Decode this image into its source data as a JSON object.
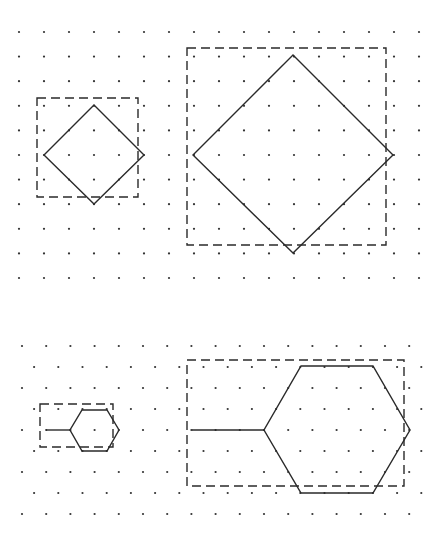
{
  "colors": {
    "ink": "#2a2a2a",
    "dot": "#333333",
    "background": "#ffffff"
  },
  "square_grid": {
    "type": "square",
    "columns": 17,
    "rows": 11
  },
  "isometric_grid": {
    "type": "isometric",
    "rows": 9,
    "dots_per_row": 17
  },
  "figures": [
    {
      "id": "small-diamond",
      "grid": "square",
      "shape": "square rotated 45 degrees",
      "vertices_grid_units": [
        [
          3,
          3
        ],
        [
          1,
          5
        ],
        [
          3,
          7
        ],
        [
          5,
          5
        ]
      ],
      "bounding_box": "dashed"
    },
    {
      "id": "large-diamond",
      "grid": "square",
      "shape": "square rotated 45 degrees",
      "vertices_grid_units": [
        [
          11,
          1
        ],
        [
          7,
          5
        ],
        [
          11,
          9
        ],
        [
          15,
          5
        ]
      ],
      "bounding_box": "dashed",
      "scale_factor": 2
    },
    {
      "id": "small-hexagon",
      "grid": "isometric",
      "shape": "hexagon with tail",
      "bounding_box": "dashed"
    },
    {
      "id": "large-hexagon",
      "grid": "isometric",
      "shape": "hexagon with tail",
      "bounding_box": "dashed",
      "scale_factor": 3
    }
  ]
}
